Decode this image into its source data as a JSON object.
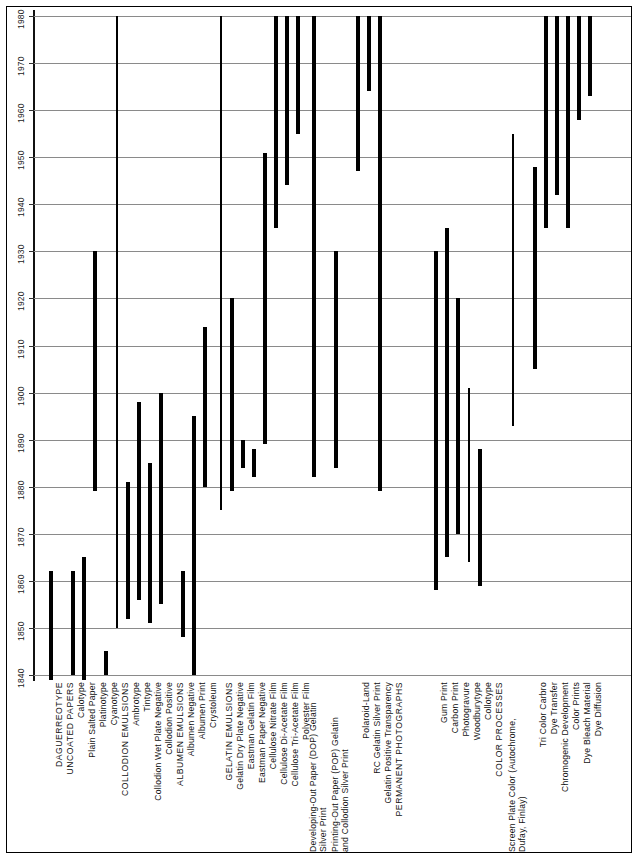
{
  "figure": {
    "orientation": "vertical-time-bars",
    "bar_color": "#000000",
    "grid_color": "#8a8a8a"
  },
  "yaxis": {
    "label": "",
    "min": 1840,
    "max": 1980,
    "step": 10,
    "ticks": [
      "1840",
      "1850",
      "1860",
      "1870",
      "1880",
      "1890",
      "1900",
      "1910",
      "1920",
      "1930",
      "1940",
      "1950",
      "1960",
      "1970",
      "1980"
    ]
  },
  "chart_data": {
    "type": "bar",
    "xlabel": "",
    "ylabel": "Year",
    "ylim": [
      1840,
      1980
    ],
    "grid": true,
    "legend": "none",
    "orientation": "vertical-ranges",
    "note": "Each bar spans the start and end year a photographic process was in use. Uppercase entries are section headings.",
    "categories": [
      "DAGUERREOTYPE",
      "UNCOATED PAPERS",
      "Calotype",
      "Plain Salted Paper",
      "Platinotype",
      "Cyanotype",
      "COLLODION EMULSIONS",
      "Ambrotype",
      "Tintype",
      "Collodion Wet Plate Negative",
      "Collodion Positive",
      "ALBUMEN EMULSIONS",
      "Albumen Negative",
      "Albumen Print",
      "Crystoleum",
      "GELATIN EMULSIONS",
      "Gelatin Dry Plate Negative",
      "Eastman Gelatin Film",
      "Eastman Paper Negative",
      "Cellulose Nitrate Film",
      "Cellulose Di-Acetate Film",
      "Cellulose Tri-Acetate Film",
      "Polyester Film",
      "Developing-Out Paper (DOP) Gelatin Silver Print",
      "Printing-Out Paper (POP) Gelatin and Collodion Silver Print",
      "Polaroid-Land",
      "RC Gelatin Silver Print",
      "Gelatin Positive Transparency",
      "PERMANENT PHOTOGRAPHS",
      "Gum Print",
      "Carbon Print",
      "Photogravure",
      "Woodburytype",
      "Collotype",
      "COLOR PROCESSES",
      "Screen Plate Color (Autochrome, Dufay, Finlay)",
      "Tri Color Carbro",
      "Dye Transfer",
      "Chromogenic Development",
      "Color Prints",
      "Dye Bleach Material",
      "Dye Diffusion"
    ],
    "bars": [
      {
        "label": "DAGUERREOTYPE",
        "heading": false,
        "start": 1839,
        "end": 1862,
        "weight": "thick"
      },
      {
        "label": "UNCOATED PAPERS",
        "heading": true,
        "start": null,
        "end": null
      },
      {
        "label": "Calotype",
        "heading": false,
        "start": 1840,
        "end": 1862,
        "weight": "thick"
      },
      {
        "label": "Plain Salted Paper",
        "heading": false,
        "start": 1839,
        "end": 1865,
        "weight": "thick"
      },
      {
        "label": "Platinotype",
        "heading": false,
        "start": 1879,
        "end": 1930,
        "weight": "thick"
      },
      {
        "label": "Cyanotype",
        "heading": false,
        "start": 1840,
        "end": 1845,
        "weight": "thick"
      },
      {
        "label": "COLLODION EMULSIONS",
        "heading": true,
        "start": 1850,
        "end": 1980,
        "weight": "thin"
      },
      {
        "label": "Ambrotype",
        "heading": false,
        "start": 1852,
        "end": 1881,
        "weight": "thick"
      },
      {
        "label": "Tintype",
        "heading": false,
        "start": 1856,
        "end": 1898,
        "weight": "thick"
      },
      {
        "label": "Collodion Wet Plate Negative",
        "heading": false,
        "start": 1851,
        "end": 1885,
        "weight": "thick"
      },
      {
        "label": "Collodion Positive",
        "heading": false,
        "start": 1855,
        "end": 1900,
        "weight": "thick"
      },
      {
        "label": "ALBUMEN EMULSIONS",
        "heading": true,
        "start": null,
        "end": null
      },
      {
        "label": "Albumen Negative",
        "heading": false,
        "start": 1848,
        "end": 1862,
        "weight": "thick"
      },
      {
        "label": "Albumen Print",
        "heading": false,
        "start": 1840,
        "end": 1895,
        "weight": "thick"
      },
      {
        "label": "Crystoleum",
        "heading": false,
        "start": 1880,
        "end": 1914,
        "weight": "thick"
      },
      {
        "label": "GELATIN EMULSIONS",
        "heading": true,
        "start": 1875,
        "end": 1980,
        "weight": "thin"
      },
      {
        "label": "Gelatin Dry Plate Negative",
        "heading": false,
        "start": 1879,
        "end": 1920,
        "weight": "thick"
      },
      {
        "label": "Eastman Gelatin Film",
        "heading": false,
        "start": 1884,
        "end": 1890,
        "weight": "thick"
      },
      {
        "label": "Eastman Paper Negative",
        "heading": false,
        "start": 1882,
        "end": 1888,
        "weight": "thick"
      },
      {
        "label": "Cellulose Nitrate Film",
        "heading": false,
        "start": 1889,
        "end": 1951,
        "weight": "thick"
      },
      {
        "label": "Cellulose Di-Acetate Film",
        "heading": false,
        "start": 1935,
        "end": 1980,
        "weight": "thick"
      },
      {
        "label": "Cellulose Tri-Acetate Film",
        "heading": false,
        "start": 1944,
        "end": 1980,
        "weight": "thick"
      },
      {
        "label": "Polyester Film",
        "heading": false,
        "start": 1955,
        "end": 1980,
        "weight": "thick"
      },
      {
        "label": "Developing-Out Paper (DOP) Gelatin Silver Print",
        "heading": false,
        "start": 1882,
        "end": 1980,
        "weight": "thick"
      },
      {
        "label": "Printing-Out Paper (POP) Gelatin and Collodion Silver Print",
        "heading": false,
        "start": 1884,
        "end": 1930,
        "weight": "thick"
      },
      {
        "label": "Polaroid-Land",
        "heading": false,
        "start": 1947,
        "end": 1980,
        "weight": "thick"
      },
      {
        "label": "RC Gelatin Silver Print",
        "heading": false,
        "start": 1964,
        "end": 1980,
        "weight": "thick"
      },
      {
        "label": "Gelatin Positive Transparency",
        "heading": false,
        "start": 1879,
        "end": 1980,
        "weight": "thick"
      },
      {
        "label": "PERMANENT PHOTOGRAPHS",
        "heading": true,
        "start": null,
        "end": null
      },
      {
        "label": "Gum Print",
        "heading": false,
        "start": 1858,
        "end": 1930,
        "weight": "thick"
      },
      {
        "label": "Carbon Print",
        "heading": false,
        "start": 1865,
        "end": 1935,
        "weight": "thick"
      },
      {
        "label": "Photogravure",
        "heading": false,
        "start": 1870,
        "end": 1920,
        "weight": "thick"
      },
      {
        "label": "Woodburytype",
        "heading": false,
        "start": 1864,
        "end": 1901,
        "weight": "thin"
      },
      {
        "label": "Collotype",
        "heading": false,
        "start": 1859,
        "end": 1888,
        "weight": "thick"
      },
      {
        "label": "COLOR PROCESSES",
        "heading": true,
        "start": null,
        "end": null
      },
      {
        "label": "Screen Plate Color (Autochrome, Dufay, Finlay)",
        "heading": false,
        "start": 1893,
        "end": 1955,
        "weight": "thin"
      },
      {
        "label": "Tri Color Carbro",
        "heading": false,
        "start": 1905,
        "end": 1948,
        "weight": "thick"
      },
      {
        "label": "Dye Transfer",
        "heading": false,
        "start": 1935,
        "end": 1980,
        "weight": "thick"
      },
      {
        "label": "Chromogenic Development",
        "heading": false,
        "start": 1942,
        "end": 1980,
        "weight": "thick"
      },
      {
        "label": "Color Prints",
        "heading": false,
        "start": 1935,
        "end": 1980,
        "weight": "thick"
      },
      {
        "label": "Dye Bleach Material",
        "heading": false,
        "start": 1958,
        "end": 1980,
        "weight": "thick"
      },
      {
        "label": "Dye Diffusion",
        "heading": false,
        "start": 1963,
        "end": 1980,
        "weight": "thick"
      }
    ]
  },
  "label_columns": [
    {
      "label": "DAGUERREOTYPE",
      "x": 51,
      "heading": true
    },
    {
      "label": "UNCOATED PAPERS",
      "x": 62,
      "heading": true
    },
    {
      "label": "Calotype",
      "x": 73,
      "heading": false
    },
    {
      "label": "Plain Salted Paper",
      "x": 84,
      "heading": false
    },
    {
      "label": "Platinotype",
      "x": 95,
      "heading": false
    },
    {
      "label": "Cyanotype",
      "x": 106,
      "heading": false
    },
    {
      "label": "COLLODION EMULSIONS",
      "x": 117,
      "heading": true
    },
    {
      "label": "Ambrotype",
      "x": 128,
      "heading": false
    },
    {
      "label": "Tintype",
      "x": 139,
      "heading": false
    },
    {
      "label": "Collodion Wet Plate Negative",
      "x": 150,
      "heading": false
    },
    {
      "label": "Collodion Positive",
      "x": 161,
      "heading": false
    },
    {
      "label": "ALBUMEN EMULSIONS",
      "x": 172,
      "heading": true
    },
    {
      "label": "Albumen Negative",
      "x": 183,
      "heading": false
    },
    {
      "label": "Albumen Print",
      "x": 194,
      "heading": false
    },
    {
      "label": "Crystoleum",
      "x": 205,
      "heading": false
    },
    {
      "label": "GELATIN EMULSIONS",
      "x": 221,
      "heading": true
    },
    {
      "label": "Gelatin Dry Plate Negative",
      "x": 232,
      "heading": false
    },
    {
      "label": "Eastman Gelatin Film",
      "x": 243,
      "heading": false
    },
    {
      "label": "Eastman Paper Negative",
      "x": 254,
      "heading": false
    },
    {
      "label": "Cellulose Nitrate Film",
      "x": 265,
      "heading": false
    },
    {
      "label": "Cellulose Di-Acetate Film",
      "x": 276,
      "heading": false
    },
    {
      "label": "Cellulose Tri-Acetate Film",
      "x": 287,
      "heading": false
    },
    {
      "label": "Polyester Film",
      "x": 298,
      "heading": false
    },
    {
      "label": "Developing-Out Paper (DOP) Gelatin Silver Print",
      "x": 314,
      "heading": false
    },
    {
      "label": "Printing-Out Paper (POP) Gelatin and Collodion Silver Print",
      "x": 336,
      "heading": false
    },
    {
      "label": "Polaroid-Land",
      "x": 358,
      "heading": false
    },
    {
      "label": "RC Gelatin Silver Print",
      "x": 369,
      "heading": false
    },
    {
      "label": "Gelatin Positive Transparency",
      "x": 380,
      "heading": false
    },
    {
      "label": "PERMANENT PHOTOGRAPHS",
      "x": 391,
      "heading": true
    },
    {
      "label": "Gum Print",
      "x": 436,
      "heading": false
    },
    {
      "label": "Carbon Print",
      "x": 447,
      "heading": false
    },
    {
      "label": "Photogravure",
      "x": 458,
      "heading": false
    },
    {
      "label": "Woodburytype",
      "x": 469,
      "heading": false
    },
    {
      "label": "Collotype",
      "x": 480,
      "heading": false
    },
    {
      "label": "COLOR PROCESSES",
      "x": 491,
      "heading": true
    },
    {
      "label": "Screen Plate Color (Autochrome, Dufay, Finlay)",
      "x": 513,
      "heading": false
    },
    {
      "label": "Tri Color Carbro",
      "x": 535,
      "heading": false
    },
    {
      "label": "Dye Transfer",
      "x": 546,
      "heading": false
    },
    {
      "label": "Chromogenic Development",
      "x": 557,
      "heading": false
    },
    {
      "label": "Color Prints",
      "x": 568,
      "heading": false
    },
    {
      "label": "Dye Bleach Material",
      "x": 579,
      "heading": false
    },
    {
      "label": "Dye Diffusion",
      "x": 590,
      "heading": false
    }
  ]
}
